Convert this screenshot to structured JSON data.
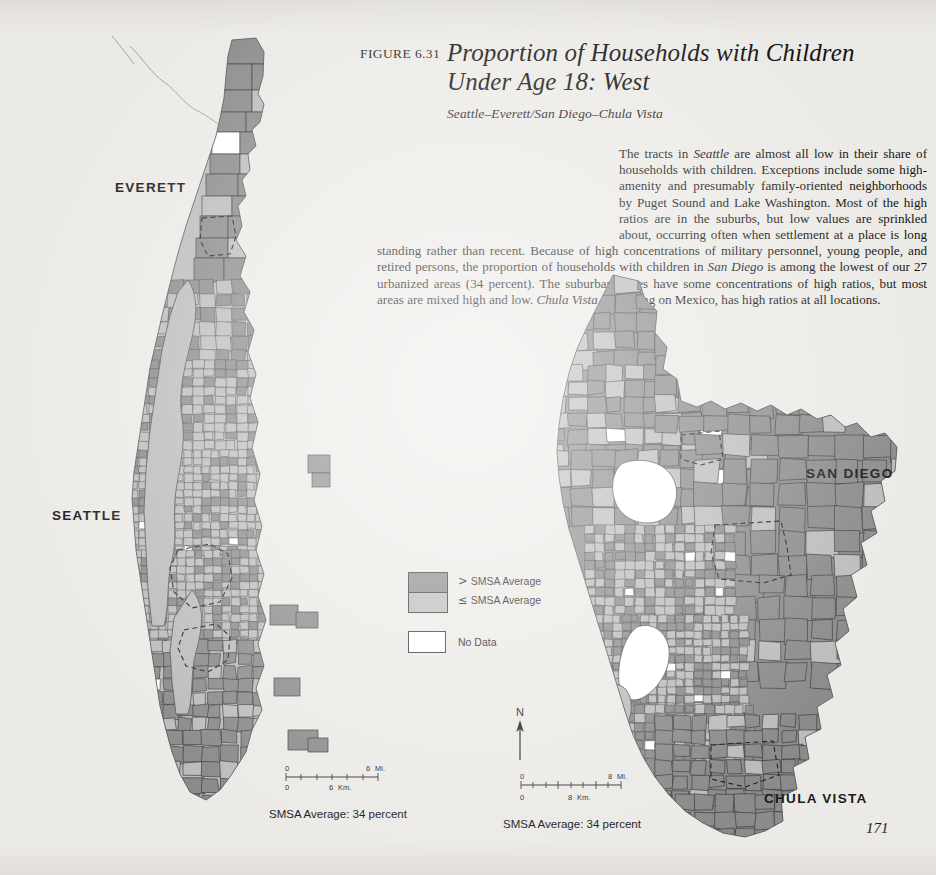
{
  "figure": {
    "label": "FIGURE 6.31",
    "title_line1": "Proportion of Households with Children",
    "title_line2": "Under Age 18: West",
    "subtitle": "Seattle–Everett/San Diego–Chula Vista"
  },
  "body_text": "The tracts in Seattle are almost all low in their share of households with children. Exceptions include some high-amenity and presumably family-oriented neighborhoods by Puget Sound and Lake Washington. Most of the high ratios are in the suburbs, but low values are sprinkled about, occurring often when settlement at a place is long standing rather than recent. Because of high concentrations of military personnel, young people, and retired persons, the proportion of households with children in San Diego is among the lowest of our 27 urbanized areas (34 percent). The suburban edges have some concentrations of high ratios, but most areas are mixed high and low. Chula Vista, bordering on Mexico, has high ratios at all locations.",
  "body_text_runs": [
    {
      "t": "The tracts in ",
      "i": false
    },
    {
      "t": "Seattle",
      "i": true
    },
    {
      "t": " are almost all low in their share of households with children. Exceptions include some high-amenity and presumably family-oriented neighborhoods by Puget Sound and Lake Washington. Most of the high ratios are in the suburbs, but low values are sprinkled about, occurring often when settlement at a place is long standing rather than recent. Because of high concentrations of military personnel, young people, and retired persons, the proportion of households with children in ",
      "i": false
    },
    {
      "t": "San Diego",
      "i": true
    },
    {
      "t": " is among the lowest of our 27 urbanized areas (34 percent). The suburban edges have some concentrations of high ratios, but most areas are mixed high and low. ",
      "i": false
    },
    {
      "t": "Chula Vista",
      "i": true
    },
    {
      "t": ", bordering on Mexico, has high ratios at all locations.",
      "i": false
    }
  ],
  "legend": {
    "above_symbol": ">",
    "above_label": "SMSA Average",
    "below_symbol": "≤",
    "below_label": "SMSA Average",
    "nodata_label": "No Data"
  },
  "city_labels": {
    "everett": "EVERETT",
    "seattle": "SEATTLE",
    "san_diego": "SAN DIEGO",
    "chula_vista": "CHULA VISTA"
  },
  "north_arrow": {
    "letter": "N"
  },
  "scale_seattle": {
    "miles_zero": "0",
    "miles_max": "6",
    "miles_unit": "Mi.",
    "km_zero": "0",
    "km_max": "6",
    "km_unit": "Km."
  },
  "scale_sandiego": {
    "miles_zero": "0",
    "miles_max": "8",
    "miles_unit": "Mi.",
    "km_zero": "0",
    "km_max": "8",
    "km_unit": "Km."
  },
  "captions": {
    "seattle_smsa": "SMSA Average:  34 percent",
    "sandiego_smsa": "SMSA Average:  34 percent"
  },
  "page_number": "171",
  "colors": {
    "page_background": "#eceae6",
    "above_average": "#8b8b8b",
    "below_average": "#bcbcbc",
    "no_data": "#ffffff",
    "outline": "#4a4a4a",
    "text": "#151515"
  },
  "chart_data": {
    "type": "map",
    "title": "Proportion of Households with Children Under Age 18: West",
    "subtitle": "Seattle–Everett/San Diego–Chula Vista",
    "variable": "Share of households with children under age 18",
    "classification": "two-class choropleth relative to SMSA average",
    "classes": [
      {
        "label": "> SMSA Average",
        "color": "#8b8b8b"
      },
      {
        "label": "≤ SMSA Average",
        "color": "#bcbcbc"
      },
      {
        "label": "No Data",
        "color": "#ffffff"
      }
    ],
    "panels": [
      {
        "name": "Seattle–Everett",
        "smsa_average_percent": 34,
        "scale_miles": 6,
        "scale_km": 6,
        "place_labels": [
          "EVERETT",
          "SEATTLE"
        ]
      },
      {
        "name": "San Diego–Chula Vista",
        "smsa_average_percent": 34,
        "scale_miles": 8,
        "scale_km": 8,
        "place_labels": [
          "SAN DIEGO",
          "CHULA VISTA"
        ]
      }
    ]
  }
}
